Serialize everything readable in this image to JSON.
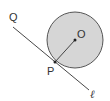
{
  "diagram": {
    "type": "geometry",
    "labels": {
      "center": "O",
      "tangent_point": "P",
      "line_point": "Q",
      "line": "ℓ"
    },
    "colors": {
      "circle_fill": "#d6d6d6",
      "stroke": "#333333"
    }
  }
}
